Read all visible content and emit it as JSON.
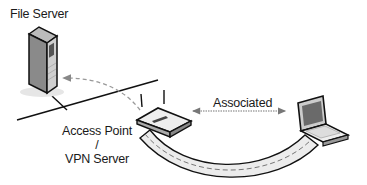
{
  "diagram": {
    "type": "network-topology",
    "nodes": [
      {
        "id": "file-server",
        "label": "File Server",
        "icon": "server-tower-icon"
      },
      {
        "id": "access-point",
        "label_line1": "Access Point /",
        "label_line2": "VPN Server",
        "icon": "wireless-router-icon"
      },
      {
        "id": "laptop",
        "label": "",
        "icon": "laptop-icon"
      }
    ],
    "edges": [
      {
        "from": "file-server",
        "to": "access-point",
        "style": "solid",
        "desc": "wired LAN segment"
      },
      {
        "from": "access-point",
        "to": "file-server",
        "style": "dashed-arrow",
        "desc": "traffic to file server"
      },
      {
        "from": "access-point",
        "to": "laptop",
        "style": "dotted-double-arrow",
        "label": "Associated"
      },
      {
        "from": "access-point",
        "to": "laptop",
        "style": "tunnel",
        "desc": "VPN tunnel"
      }
    ]
  },
  "labels": {
    "file_server": "File Server",
    "ap_line1": "Access Point /",
    "ap_line2": "VPN Server",
    "associated": "Associated"
  },
  "colors": {
    "line": "#111111",
    "tunnel_fill": "#e8e8e8",
    "dash": "#888888",
    "device_face": "#d9d9d9",
    "screen": "#6a6a6a"
  }
}
